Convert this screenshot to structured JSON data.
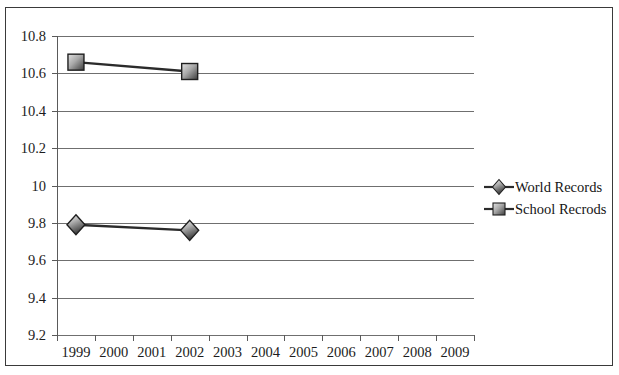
{
  "chart_data": {
    "type": "line",
    "title": "",
    "subtitle": "",
    "xlabel": "",
    "ylabel": "",
    "categories": [
      "1999",
      "2000",
      "2001",
      "2002",
      "2003",
      "2004",
      "2005",
      "2006",
      "2007",
      "2008",
      "2009"
    ],
    "ylim": [
      9.2,
      10.8
    ],
    "ytick_labels": [
      "10.8",
      "10.6",
      "10.4",
      "10.2",
      "10",
      "9.8",
      "9.6",
      "9.4",
      "9.2"
    ],
    "ytick_values": [
      10.8,
      10.6,
      10.4,
      10.2,
      10.0,
      9.8,
      9.6,
      9.4,
      9.2
    ],
    "grid": true,
    "legend_position": "right",
    "series": [
      {
        "name": "World Records",
        "marker": "diamond",
        "color": "#2b2b2b",
        "x": [
          "1999",
          "2002"
        ],
        "values": [
          9.79,
          9.76
        ]
      },
      {
        "name": "School Recrods",
        "marker": "square",
        "color": "#2b2b2b",
        "x": [
          "1999",
          "2002"
        ],
        "values": [
          10.66,
          10.61
        ]
      }
    ]
  },
  "legend": {
    "items": [
      {
        "label": "World Records",
        "marker": "diamond"
      },
      {
        "label": "School Recrods",
        "marker": "square"
      }
    ]
  },
  "colors": {
    "axis": "#5a5a5a",
    "grid": "#6f6f6f",
    "border": "#3a3a3a",
    "text": "#1c1c1c",
    "marker_dark": "#1f1f1f",
    "marker_light": "#d8d8d8",
    "series_line": "#2b2b2b"
  }
}
